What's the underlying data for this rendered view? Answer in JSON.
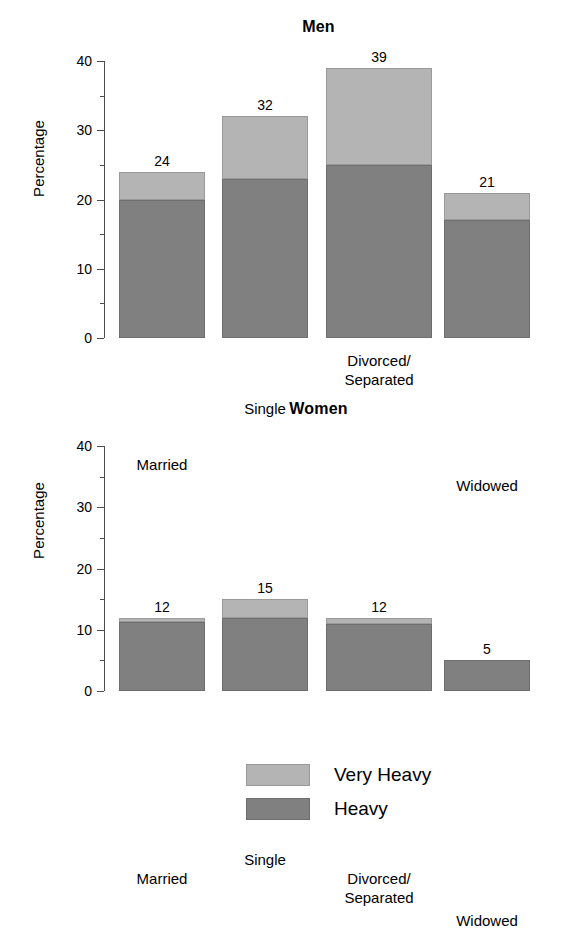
{
  "figure": {
    "legend": {
      "items": [
        {
          "label": "Very Heavy",
          "color": "#b4b4b4",
          "key": "very_heavy"
        },
        {
          "label": "Heavy",
          "color": "#808080",
          "key": "heavy"
        }
      ]
    }
  },
  "chart_data": [
    {
      "type": "bar",
      "stacked": true,
      "title": "Men",
      "xlabel": "",
      "ylabel": "Percentage",
      "ylim": [
        0,
        40
      ],
      "yticks": [
        0,
        10,
        20,
        30,
        40
      ],
      "yticks_minor": [
        5,
        15,
        25,
        35
      ],
      "grid": false,
      "legend_position": "bottom",
      "categories": [
        "Married",
        "Single",
        "Divorced/\nSeparated",
        "Widowed"
      ],
      "category_labels": [
        [
          "Married"
        ],
        [
          "Single"
        ],
        [
          "Divorced/",
          "Separated"
        ],
        [
          "Widowed"
        ]
      ],
      "series": [
        {
          "name": "Heavy",
          "color": "#808080",
          "values": [
            20,
            23,
            25,
            17
          ]
        },
        {
          "name": "Very Heavy",
          "color": "#b4b4b4",
          "values": [
            4,
            9,
            14,
            4
          ]
        }
      ],
      "totals": [
        24,
        32,
        39,
        21
      ],
      "total_labels": [
        "24",
        "32",
        "39",
        "21"
      ]
    },
    {
      "type": "bar",
      "stacked": true,
      "title": "Women",
      "xlabel": "",
      "ylabel": "Percentage",
      "ylim": [
        0,
        40
      ],
      "yticks": [
        0,
        10,
        20,
        30,
        40
      ],
      "yticks_minor": [
        5,
        15,
        25,
        35
      ],
      "grid": false,
      "legend_position": "bottom",
      "categories": [
        "Married",
        "Single",
        "Divorced/\nSeparated",
        "Widowed"
      ],
      "category_labels": [
        [
          "Married"
        ],
        [
          "Single"
        ],
        [
          "Divorced/",
          "Separated"
        ],
        [
          "Widowed"
        ]
      ],
      "series": [
        {
          "name": "Heavy",
          "color": "#808080",
          "values": [
            11.3,
            12,
            11,
            5
          ]
        },
        {
          "name": "Very Heavy",
          "color": "#b4b4b4",
          "values": [
            0.7,
            3,
            1,
            0
          ]
        }
      ],
      "totals": [
        12,
        15,
        12,
        5
      ],
      "total_labels": [
        "12",
        "15",
        "12",
        "5"
      ]
    }
  ]
}
